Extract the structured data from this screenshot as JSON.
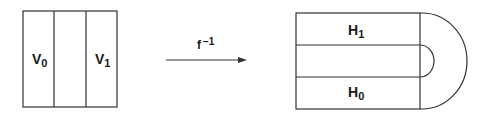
{
  "left_figure": {
    "labels": [
      {
        "base": "V",
        "sub": "0"
      },
      {
        "base": "V",
        "sub": "1"
      }
    ]
  },
  "map": {
    "base": "f",
    "sup": "−1"
  },
  "right_figure": {
    "labels": [
      {
        "base": "H",
        "sub": "1"
      },
      {
        "base": "H",
        "sub": "0"
      }
    ]
  },
  "colors": {
    "stroke": "#333333",
    "text": "#1a1a1a",
    "background": "#ffffff"
  }
}
